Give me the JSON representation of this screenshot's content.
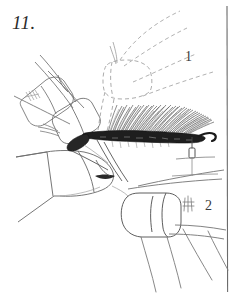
{
  "plate": {
    "figure_number": "11.",
    "background_color": "#ffffff",
    "ink_color": "#3a3a3a",
    "dark_ink_color": "#1a1a1a",
    "width": 237,
    "height": 296
  },
  "border": {
    "name": "right-plate-rule",
    "orientation": "vertical",
    "x": 227,
    "y_start": 6,
    "y_end": 292,
    "color": "#6b6b6b"
  },
  "callouts": [
    {
      "label": "1",
      "x": 185,
      "y": 49,
      "refers_to": "upper-leg-segment"
    },
    {
      "label": "2",
      "x": 205,
      "y": 198,
      "refers_to": "lower-leg-segment"
    }
  ],
  "features": {
    "setal_comb": {
      "name": "setal-comb-brush",
      "description": "dense brush of setae along dark sclerotized band",
      "band_color": "#1c1c1c",
      "seta_color": "#4a4a4a",
      "band_x_start": 85,
      "band_x_end": 203,
      "band_y": 136,
      "seta_count": 74
    },
    "ghost_segment": {
      "name": "dashed-ghost-segment",
      "description": "dashed outline showing alternate segment position",
      "color": "#9a9a9a",
      "dash": "4 3"
    },
    "spur": {
      "name": "tibial-spur-peg",
      "x": 192,
      "y": 152
    },
    "seta_tuft": {
      "name": "small-seta-tuft",
      "x": 188,
      "y": 205
    }
  },
  "caption_text": ""
}
